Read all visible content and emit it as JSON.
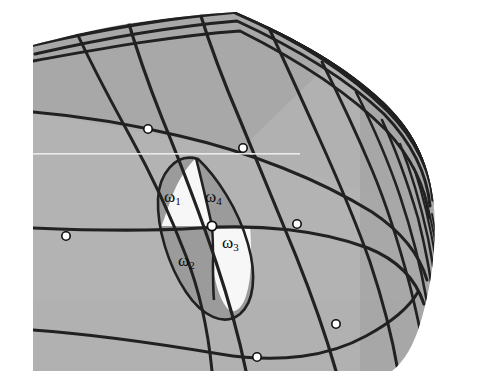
{
  "figure": {
    "canvas": {
      "width": 478,
      "height": 386,
      "background": "#ffffff"
    },
    "surface": {
      "fill_light": "#b1b1b1",
      "fill_dark": "#9b9b9b",
      "fill_white": "#ffffff",
      "line_color": "#111111",
      "node_fill": "#ffffff",
      "node_stroke": "#111111",
      "scanline_color": "#f2f2f2"
    },
    "labels": [
      {
        "id": "w1",
        "base": "ω",
        "sub": "1",
        "x": 164,
        "y": 188,
        "on_fill": "white-region"
      },
      {
        "id": "w4",
        "base": "ω",
        "sub": "4",
        "x": 205,
        "y": 188,
        "on_fill": "dark-region"
      },
      {
        "id": "w2",
        "base": "ω",
        "sub": "2",
        "x": 178,
        "y": 252,
        "on_fill": "dark-region"
      },
      {
        "id": "w3",
        "base": "ω",
        "sub": "3",
        "x": 222,
        "y": 234,
        "on_fill": "white-region"
      }
    ],
    "nodes": [
      {
        "id": "n1",
        "x": 148,
        "y": 129,
        "r": 4.2
      },
      {
        "id": "n2",
        "x": 243,
        "y": 148,
        "r": 4.2
      },
      {
        "id": "n3",
        "x": 66,
        "y": 236,
        "r": 4.2
      },
      {
        "id": "n4",
        "x": 212,
        "y": 226,
        "r": 4.6
      },
      {
        "id": "n5",
        "x": 297,
        "y": 224,
        "r": 4.2
      },
      {
        "id": "n6",
        "x": 336,
        "y": 324,
        "r": 4.2
      },
      {
        "id": "n7",
        "x": 257,
        "y": 357,
        "r": 4.2
      }
    ],
    "scanline": {
      "y": 153.5,
      "x_start": 33,
      "x_end": 300
    },
    "geometry_note": "Curved quadrilateral surface patch viewed obliquely; grid lines condense toward the right-hand silhouette edge."
  }
}
